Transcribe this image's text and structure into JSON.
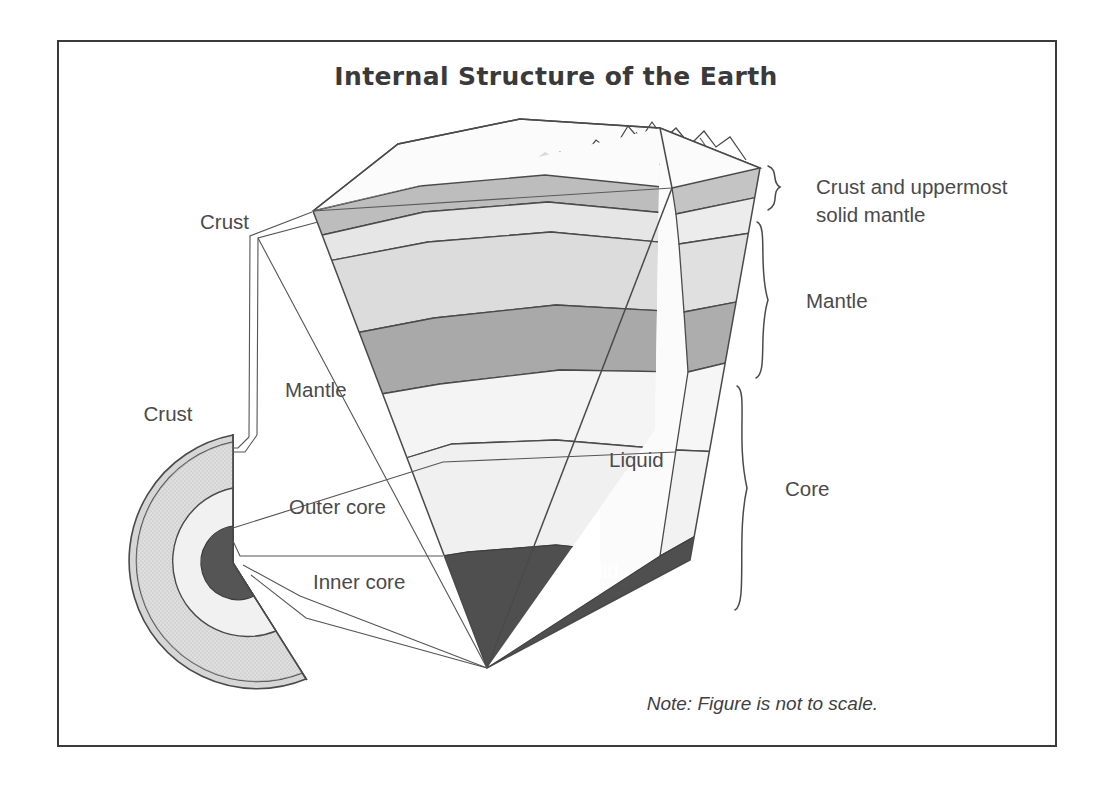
{
  "figure": {
    "title": "Internal Structure of the Earth",
    "note": "Note: Figure is not to scale."
  },
  "colors": {
    "ink": "#4a4a4a",
    "title_ink": "#3a3a3a",
    "frame": "#3a3a3a",
    "paper": "#ffffff",
    "crust_band": "#b9b9b9",
    "upper_mantle_light": "#e2e2e2",
    "mantle_mid": "#d2d2d2",
    "mantle_dark_band": "#a8a8a8",
    "mantle_pale": "#efefef",
    "outer_core": "#ededed",
    "inner_core": "#4f4f4f",
    "globe_mantle": "#c9c9c9",
    "globe_outer_core": "#f0f0f0",
    "globe_inner_core": "#555555"
  },
  "wedge_labels": {
    "liquid": "Liquid",
    "solid": "Solid"
  },
  "left_labels": {
    "crust_wedge": "Crust",
    "mantle_wedge": "Mantle",
    "crust_globe": "Crust",
    "outer_core": "Outer core",
    "inner_core": "Inner core"
  },
  "right_braces": [
    {
      "key": "lithosphere",
      "line1": "Crust and uppermost",
      "line2": "solid mantle"
    },
    {
      "key": "mantle",
      "line1": "Mantle",
      "line2": ""
    },
    {
      "key": "core",
      "line1": "Core",
      "line2": ""
    }
  ],
  "diagram_data": {
    "type": "cutaway-cross-section",
    "subject": "Earth internal layers",
    "layers": [
      {
        "name": "Crust",
        "state": "solid",
        "shown_in": [
          "wedge",
          "globe"
        ]
      },
      {
        "name": "Uppermost solid mantle",
        "state": "solid",
        "shown_in": [
          "wedge"
        ]
      },
      {
        "name": "Mantle",
        "state": "solid",
        "shown_in": [
          "wedge",
          "globe"
        ]
      },
      {
        "name": "Outer core",
        "state": "Liquid",
        "shown_in": [
          "wedge",
          "globe"
        ]
      },
      {
        "name": "Inner core",
        "state": "Solid",
        "shown_in": [
          "wedge",
          "globe"
        ]
      }
    ],
    "groupings": [
      {
        "bracket": "Crust and uppermost solid mantle",
        "covers": [
          "Crust",
          "Uppermost solid mantle"
        ]
      },
      {
        "bracket": "Mantle",
        "covers": [
          "Mantle"
        ]
      },
      {
        "bracket": "Core",
        "covers": [
          "Outer core",
          "Inner core"
        ]
      }
    ]
  }
}
